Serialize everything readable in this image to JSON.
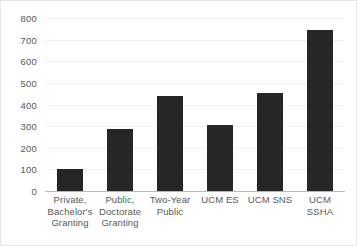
{
  "chart_data": {
    "type": "bar",
    "title": "",
    "subtitle": "",
    "xlabel": "",
    "ylabel": "",
    "categories": [
      "Private,\nBachelor's\nGranting",
      "Public,\nDoctorate\nGranting",
      "Two-Year\nPublic",
      "UCM ES",
      "UCM SNS",
      "UCM SSHA"
    ],
    "values": [
      100,
      287,
      440,
      305,
      452,
      745
    ],
    "ylim": [
      0,
      800
    ],
    "ytick_step": 100,
    "yticks": [
      "800",
      "700",
      "600",
      "500",
      "400",
      "300",
      "200",
      "100",
      "0"
    ],
    "ytick_values": [
      800,
      700,
      600,
      500,
      400,
      300,
      200,
      100,
      0
    ],
    "grid": true,
    "legend": false,
    "legend_position": "none",
    "bar_color": "#262626",
    "gridline_color": "#f0f0f0",
    "axis_color": "#b8b8b8",
    "background_color": "#ffffff",
    "border_color": "#e6e6e6",
    "tick_label_color": "#585858"
  }
}
